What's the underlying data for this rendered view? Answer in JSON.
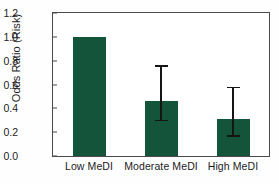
{
  "chart_data": {
    "type": "bar",
    "title": "",
    "subtitle": "",
    "xlabel": "",
    "ylabel": "Odds Ratio (Risk)",
    "categories": [
      "Low MeDI",
      "Moderate MeDI",
      "High MeDI"
    ],
    "values": [
      1.0,
      0.46,
      0.31
    ],
    "error_low": [
      null,
      0.29,
      0.16
    ],
    "error_high": [
      null,
      0.76,
      0.58
    ],
    "ylim": [
      0.0,
      1.2
    ],
    "ytick_labels": [
      "0.0",
      "0.2",
      "0.4",
      "0.6",
      "0.8",
      "1.0",
      "1.2"
    ],
    "ytick_values": [
      0.0,
      0.2,
      0.4,
      0.6,
      0.8,
      1.0,
      1.2
    ],
    "grid": false,
    "legend": null,
    "legend_position": "none",
    "bar_color": "#14543a",
    "error_color": "#151515",
    "axis_color": "#4a4a4a",
    "background_color": "#ffffff",
    "annotations": []
  }
}
